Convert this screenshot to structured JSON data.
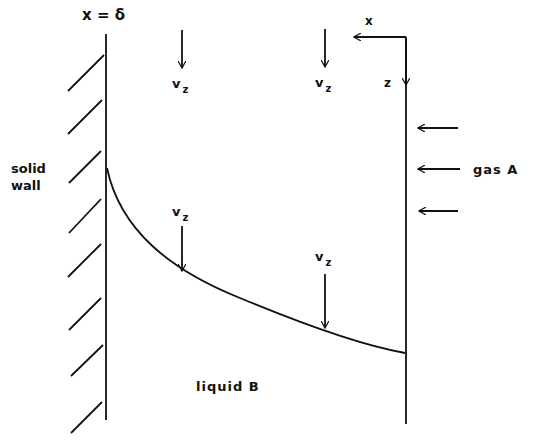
{
  "diagram": {
    "boundary_label": "x = δ",
    "solid_wall_label_line1": "solid",
    "solid_wall_label_line2": "wall",
    "gas_label": "gas A",
    "liquid_label": "liquid B",
    "axis_x_label": "x",
    "axis_z_label": "z",
    "velocity_labels": [
      {
        "main": "v",
        "sub": "z"
      },
      {
        "main": "v",
        "sub": "z"
      },
      {
        "main": "v",
        "sub": "z"
      },
      {
        "main": "v",
        "sub": "z"
      }
    ],
    "colors": {
      "ink": "#111111",
      "background": "#ffffff"
    }
  }
}
